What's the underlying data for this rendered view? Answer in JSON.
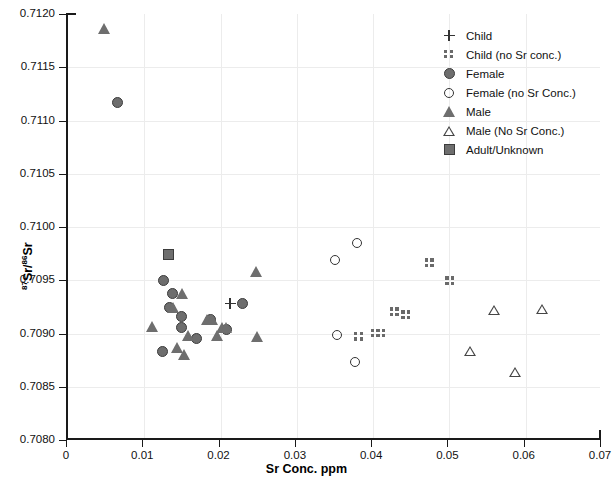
{
  "chart_data": {
    "type": "scatter",
    "title": "",
    "xlabel": "Sr Conc. ppm",
    "ylabel": "87Sr/86Sr",
    "ylabel_parts": {
      "sup1": "87",
      "mid": "Sr/",
      "sup2": "86",
      "end": "Sr"
    },
    "xlim": [
      0,
      0.07
    ],
    "ylim": [
      0.708,
      0.712
    ],
    "xticks": [
      0,
      0.01,
      0.02,
      0.03,
      0.04,
      0.05,
      0.06,
      0.07
    ],
    "xtick_labels": [
      "0",
      "0.01",
      "0.02",
      "0.03",
      "0.04",
      "0.05",
      "0.06",
      "0.07"
    ],
    "yticks": [
      0.708,
      0.7085,
      0.709,
      0.7095,
      0.71,
      0.7105,
      0.711,
      0.7115,
      0.712
    ],
    "ytick_labels": [
      "0.7080",
      "0.7085",
      "0.7090",
      "0.7095",
      "0.7100",
      "0.7105",
      "0.7110",
      "0.7115",
      "0.7120"
    ],
    "grid": true,
    "legend_position": "top-right",
    "legend": [
      {
        "label": "Child",
        "marker": "plus"
      },
      {
        "label": "Child (no Sr conc.)",
        "marker": "dots"
      },
      {
        "label": "Female",
        "marker": "filled-circle"
      },
      {
        "label": "Female (no Sr Conc.)",
        "marker": "open-circle"
      },
      {
        "label": "Male",
        "marker": "filled-triangle"
      },
      {
        "label": "Male (No Sr Conc.)",
        "marker": "open-triangle"
      },
      {
        "label": "Adult/Unknown",
        "marker": "filled-square"
      }
    ],
    "series": [
      {
        "name": "Child",
        "marker": "plus",
        "points": [
          [
            0.0215,
            0.70928
          ]
        ]
      },
      {
        "name": "Child (no Sr conc.)",
        "marker": "dots",
        "points": [
          [
            0.0477,
            0.70966
          ],
          [
            0.0504,
            0.70949
          ],
          [
            0.0431,
            0.7092
          ],
          [
            0.0446,
            0.70917
          ],
          [
            0.0406,
            0.709
          ],
          [
            0.0413,
            0.709
          ],
          [
            0.0384,
            0.70897
          ]
        ]
      },
      {
        "name": "Female",
        "marker": "filled-circle",
        "points": [
          [
            0.0068,
            0.71117
          ],
          [
            0.0128,
            0.7095
          ],
          [
            0.0139,
            0.70938
          ],
          [
            0.0136,
            0.70924
          ],
          [
            0.0152,
            0.70916
          ],
          [
            0.0231,
            0.70928
          ],
          [
            0.0152,
            0.70906
          ],
          [
            0.0189,
            0.70913
          ],
          [
            0.0211,
            0.70904
          ],
          [
            0.0171,
            0.70895
          ],
          [
            0.0126,
            0.70883
          ]
        ]
      },
      {
        "name": "Female (no Sr Conc.)",
        "marker": "open-circle",
        "points": [
          [
            0.0381,
            0.70985
          ],
          [
            0.0353,
            0.70969
          ],
          [
            0.0355,
            0.70899
          ],
          [
            0.0379,
            0.70873
          ]
        ]
      },
      {
        "name": "Male",
        "marker": "filled-triangle",
        "points": [
          [
            0.005,
            0.71186
          ],
          [
            0.025,
            0.70958
          ],
          [
            0.0153,
            0.70938
          ],
          [
            0.0141,
            0.70924
          ],
          [
            0.0185,
            0.70913
          ],
          [
            0.0192,
            0.70913
          ],
          [
            0.0114,
            0.70907
          ],
          [
            0.016,
            0.70898
          ],
          [
            0.0205,
            0.70906
          ],
          [
            0.021,
            0.70906
          ],
          [
            0.0199,
            0.70898
          ],
          [
            0.0251,
            0.70897
          ],
          [
            0.0146,
            0.70887
          ],
          [
            0.0155,
            0.7088
          ]
        ]
      },
      {
        "name": "Male (No Sr Conc.)",
        "marker": "open-triangle",
        "points": [
          [
            0.0561,
            0.70922
          ],
          [
            0.0624,
            0.70923
          ],
          [
            0.0529,
            0.70884
          ],
          [
            0.0588,
            0.70864
          ]
        ]
      },
      {
        "name": "Adult/Unknown",
        "marker": "filled-square",
        "points": [
          [
            0.0134,
            0.70974
          ]
        ]
      }
    ]
  }
}
